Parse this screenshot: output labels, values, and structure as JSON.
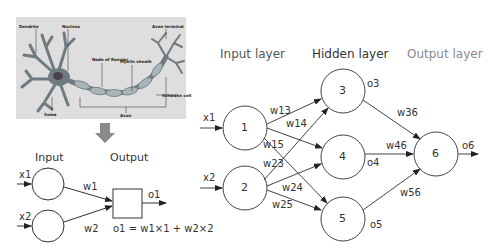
{
  "neuron_image": {
    "labels": {
      "dendrite": "Dendrite",
      "nucleus": "Nucleus",
      "axon_terminal": "Axon terminal",
      "node_of_ranvier": "Node of Ranvier",
      "myelin_sheath": "Myelin sheath",
      "schwann_cell": "Schwann cell",
      "soma": "Soma",
      "axon": "Axon"
    },
    "background": "#dedede",
    "cell_color": "#6f7b80"
  },
  "simple_model": {
    "input_title": "Input",
    "output_title": "Output",
    "inputs": [
      "x1",
      "x2"
    ],
    "weights": [
      "w1",
      "w2"
    ],
    "output": "o1",
    "formula": "o1 = w1×1 + w2×2"
  },
  "network": {
    "layers": {
      "input": "Input layer",
      "hidden": "Hidden layer",
      "output": "Output layer"
    },
    "layer_colors": {
      "input": "#555555",
      "hidden": "#333333",
      "output": "#8a8a8a"
    },
    "inputs": [
      "x1",
      "x2"
    ],
    "nodes": [
      "1",
      "2",
      "3",
      "4",
      "5",
      "6"
    ],
    "weights": {
      "w13": "w13",
      "w14": "w14",
      "w15": "w15",
      "w23": "w23",
      "w24": "w24",
      "w25": "w25",
      "w36": "w36",
      "w46": "w46",
      "w56": "w56"
    },
    "outputs": {
      "o3": "o3",
      "o4": "o4",
      "o5": "o5",
      "o6": "o6"
    }
  },
  "arrow_color": "#8a8a8a"
}
